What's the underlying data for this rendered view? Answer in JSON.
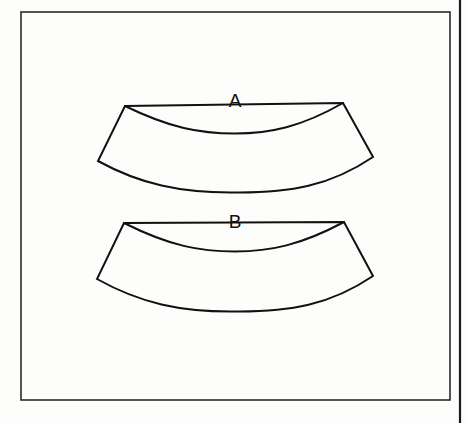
{
  "figure": {
    "kind": "jastrow-illusion-diagram",
    "background_color": "#fdfdfc",
    "ink_color": "#111111",
    "page_edge": {
      "name": "page-edge-line",
      "x": 460,
      "y1": 0,
      "y2": 423,
      "stroke_width": 2.2,
      "color": "#1a1a1a"
    },
    "frame": {
      "name": "figure-border",
      "x": 21,
      "y": 12,
      "width": 429,
      "height": 388,
      "stroke_width": 1.6,
      "color": "#2a2a2a"
    },
    "shapes": [
      {
        "id": "shape-a",
        "label": "A",
        "label_x": 235,
        "label_y": 107,
        "stroke_width": 2.0,
        "fill": "none",
        "path": "M 125 106 L 343 103 L 373 157 C 330 186 290 193 235 192.5 C 180 193 140 184 98 161 Z",
        "inner_curve": "M 125 106 C 170 128 200 133.5 235 133.5 C 270 133.5 301 127 343 103",
        "corners": {
          "top_left": [
            125,
            106
          ],
          "top_right": [
            343,
            103
          ],
          "bottom_right": [
            373,
            157
          ],
          "bottom_left": [
            98,
            161
          ]
        },
        "center_top_y": 133,
        "center_bottom_y": 192,
        "center_thickness_px": 59
      },
      {
        "id": "shape-b",
        "label": "B",
        "label_x": 235,
        "label_y": 228,
        "stroke_width": 2.0,
        "fill": "none",
        "path": "M 124 223 L 344 222 L 373 276 C 330 305 290 312 235 311.5 C 180 312 140 303 97 279 Z",
        "inner_curve": "M 124 223 C 170 246 200 251.5 235 251.5 C 270 251.5 301 245 344 222",
        "corners": {
          "top_left": [
            124,
            223
          ],
          "top_right": [
            344,
            222
          ],
          "bottom_right": [
            373,
            276
          ],
          "bottom_left": [
            97,
            279
          ]
        },
        "center_top_y": 251,
        "center_bottom_y": 311,
        "center_thickness_px": 60
      }
    ]
  }
}
